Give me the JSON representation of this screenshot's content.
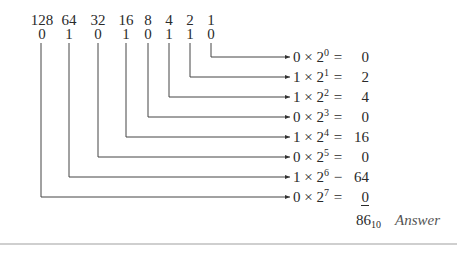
{
  "diagram": {
    "weights": [
      "128",
      "64",
      "32",
      "16",
      "8",
      "4",
      "2",
      "1"
    ],
    "bits": [
      "0",
      "1",
      "0",
      "1",
      "0",
      "1",
      "1",
      "0"
    ],
    "terms": [
      {
        "bit": "0",
        "base": "2",
        "exp": "0",
        "op": "=",
        "value": "0"
      },
      {
        "bit": "1",
        "base": "2",
        "exp": "1",
        "op": "=",
        "value": "2"
      },
      {
        "bit": "1",
        "base": "2",
        "exp": "2",
        "op": "=",
        "value": "4"
      },
      {
        "bit": "0",
        "base": "2",
        "exp": "3",
        "op": "=",
        "value": "0"
      },
      {
        "bit": "1",
        "base": "2",
        "exp": "4",
        "op": "=",
        "value": "16"
      },
      {
        "bit": "0",
        "base": "2",
        "exp": "5",
        "op": "=",
        "value": "0"
      },
      {
        "bit": "1",
        "base": "2",
        "exp": "6",
        "op": "−",
        "value": "64"
      },
      {
        "bit": "0",
        "base": "2",
        "exp": "7",
        "op": "=",
        "value": "0"
      }
    ],
    "times_symbol": "×",
    "result": {
      "value": "86",
      "base": "10",
      "label": "Answer"
    }
  }
}
